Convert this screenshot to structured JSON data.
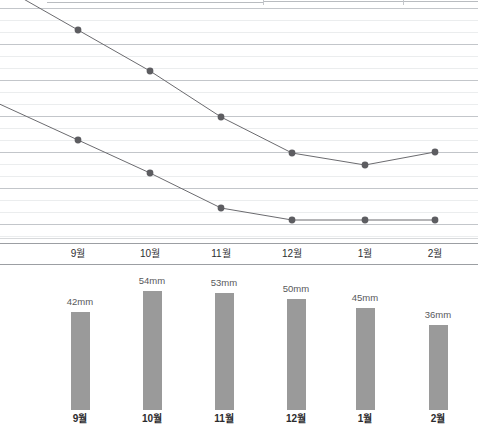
{
  "chart_data": [
    {
      "type": "line",
      "title": "",
      "xlabel": "",
      "ylabel": "",
      "grid": true,
      "legend": "none",
      "categories": [
        "9월",
        "10월",
        "11월",
        "12월",
        "1월",
        "2월"
      ],
      "series": [
        {
          "name": "upper-line",
          "color": "#6b6b6f",
          "points_px": [
            {
              "x": 78,
              "y": 30
            },
            {
              "x": 150,
              "y": 71
            },
            {
              "x": 221,
              "y": 117
            },
            {
              "x": 292,
              "y": 153
            },
            {
              "x": 365,
              "y": 165
            },
            {
              "x": 435,
              "y": 152
            }
          ]
        },
        {
          "name": "lower-line",
          "color": "#6b6b6f",
          "points_px": [
            {
              "x": 78,
              "y": 140
            },
            {
              "x": 150,
              "y": 173
            },
            {
              "x": 221,
              "y": 208
            },
            {
              "x": 292,
              "y": 220
            },
            {
              "x": 365,
              "y": 220
            },
            {
              "x": 435,
              "y": 220
            }
          ]
        }
      ]
    },
    {
      "type": "bar",
      "title": "",
      "xlabel": "",
      "ylabel": "",
      "unit": "mm",
      "categories": [
        "9월",
        "10월",
        "11월",
        "12월",
        "1월",
        "2월"
      ],
      "values": [
        42,
        54,
        53,
        50,
        45,
        36
      ],
      "value_labels": [
        "42mm",
        "54mm",
        "53mm",
        "50mm",
        "45mm",
        "36mm"
      ],
      "bar_color": "#9a9a9a",
      "ylim": [
        0,
        60
      ]
    }
  ],
  "line_chart": {
    "x_positions": [
      78,
      150,
      221,
      292,
      365,
      435
    ],
    "axis_labels": [
      "9월",
      "10월",
      "11월",
      "12월",
      "1월",
      "2월"
    ],
    "marker_color": "#5d5d61",
    "line_color": "#6b6b6f",
    "gridline_major_color": "#c3c6ca",
    "gridline_minor_color": "#ebedee"
  },
  "bar_chart": {
    "x_positions": [
      80,
      152,
      224,
      296,
      365,
      438
    ],
    "bars": [
      {
        "month": "9월",
        "label": "42mm",
        "top": 46,
        "height": 98
      },
      {
        "month": "10월",
        "label": "54mm",
        "top": 25,
        "height": 119
      },
      {
        "month": "11월",
        "label": "53mm",
        "top": 27,
        "height": 117
      },
      {
        "month": "12월",
        "label": "50mm",
        "top": 33,
        "height": 111
      },
      {
        "month": "1월",
        "label": "45mm",
        "top": 42,
        "height": 102
      },
      {
        "month": "2월",
        "label": "36mm",
        "top": 59,
        "height": 85
      }
    ],
    "label_offsets": [
      30,
      9,
      11,
      17,
      26,
      43
    ]
  }
}
